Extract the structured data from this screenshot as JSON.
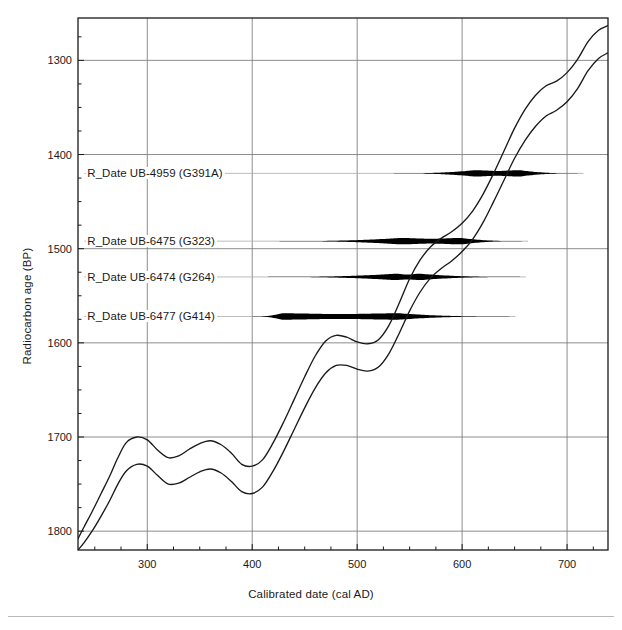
{
  "chart_data": {
    "type": "line",
    "title": "",
    "xlabel": "Calibrated date (cal AD)",
    "ylabel": "Radiocarbon age (BP)",
    "xlim": [
      234,
      739
    ],
    "ylim": [
      1820,
      1255
    ],
    "y_inverted": true,
    "grid": true,
    "legend": "none",
    "x_ticks_major": [
      300,
      400,
      500,
      600,
      700
    ],
    "x_ticks_minor_step": 25,
    "y_ticks_major": [
      1300,
      1400,
      1500,
      1600,
      1700,
      1800
    ],
    "y_ticks_minor_step": 25,
    "series": [
      {
        "name": "calibration-curve-upper",
        "x": [
          234,
          240,
          248,
          256,
          264,
          272,
          280,
          290,
          300,
          310,
          320,
          330,
          340,
          350,
          360,
          370,
          380,
          390,
          400,
          410,
          420,
          430,
          440,
          450,
          460,
          470,
          480,
          490,
          500,
          510,
          520,
          530,
          540,
          550,
          560,
          570,
          580,
          590,
          600,
          610,
          620,
          630,
          640,
          650,
          660,
          670,
          680,
          690,
          700,
          710,
          720,
          730,
          739
        ],
        "y": [
          1808,
          1795,
          1778,
          1760,
          1742,
          1722,
          1706,
          1700,
          1703,
          1714,
          1722,
          1720,
          1713,
          1707,
          1704,
          1708,
          1717,
          1729,
          1731,
          1724,
          1706,
          1684,
          1660,
          1636,
          1614,
          1598,
          1592,
          1594,
          1599,
          1601,
          1597,
          1582,
          1558,
          1532,
          1512,
          1498,
          1489,
          1482,
          1473,
          1460,
          1442,
          1420,
          1396,
          1372,
          1352,
          1337,
          1327,
          1322,
          1313,
          1299,
          1280,
          1268,
          1263
        ]
      },
      {
        "name": "calibration-curve-lower",
        "x": [
          234,
          240,
          248,
          256,
          264,
          272,
          280,
          290,
          300,
          310,
          320,
          330,
          340,
          350,
          360,
          370,
          380,
          390,
          400,
          410,
          420,
          430,
          440,
          450,
          460,
          470,
          480,
          490,
          500,
          510,
          520,
          530,
          540,
          550,
          560,
          570,
          580,
          590,
          600,
          610,
          620,
          630,
          640,
          650,
          660,
          670,
          680,
          690,
          700,
          710,
          720,
          730,
          739
        ],
        "y": [
          1820,
          1812,
          1799,
          1784,
          1768,
          1750,
          1736,
          1729,
          1731,
          1741,
          1750,
          1749,
          1743,
          1737,
          1734,
          1738,
          1747,
          1758,
          1760,
          1753,
          1736,
          1715,
          1692,
          1669,
          1648,
          1632,
          1624,
          1624,
          1628,
          1630,
          1626,
          1612,
          1590,
          1566,
          1546,
          1531,
          1521,
          1513,
          1503,
          1490,
          1472,
          1450,
          1427,
          1404,
          1385,
          1370,
          1359,
          1353,
          1344,
          1330,
          1311,
          1298,
          1292
        ]
      }
    ],
    "distributions": [
      {
        "label": "R_Date UB-4959 (G391A)",
        "lab_code": "UB-4959",
        "sample_id": "G391A",
        "baseline_bp": 1420,
        "range_start": 535,
        "range_end": 710,
        "peak_start": 612,
        "peak_end": 655,
        "label_x": 240
      },
      {
        "label": "R_Date UB-6475 (G323)",
        "lab_code": "UB-6475",
        "sample_id": "G323",
        "baseline_bp": 1492,
        "range_start": 426,
        "range_end": 657,
        "peak_start": 540,
        "peak_end": 600,
        "label_x": 240
      },
      {
        "label": "R_Date UB-6474 (G264)",
        "lab_code": "UB-6474",
        "sample_id": "G264",
        "baseline_bp": 1530,
        "range_start": 415,
        "range_end": 655,
        "peak_start": 536,
        "peak_end": 560,
        "label_x": 240
      },
      {
        "label": "R_Date UB-6477 (G414)",
        "lab_code": "UB-6477",
        "sample_id": "G414",
        "baseline_bp": 1572,
        "range_start": 400,
        "range_end": 645,
        "peak_start": 428,
        "peak_end": 540,
        "label_x": 240
      }
    ],
    "colors": {
      "curve": "#1a1a1a",
      "grid": "#808080",
      "axis": "#1a1a1a",
      "distribution": "#000000",
      "distribution_baseline": "#b0b0b0",
      "background": "#ffffff"
    }
  },
  "axes": {
    "y_title": "Radiocarbon age (BP)",
    "x_title": "Calibrated date (cal AD)",
    "y_tick_labels": [
      "1300",
      "1400",
      "1500",
      "1600",
      "1700",
      "1800"
    ],
    "x_tick_labels": [
      "300",
      "400",
      "500",
      "600",
      "700"
    ]
  },
  "labels": {
    "d0": "R_Date UB-4959 (G391A)",
    "d1": "R_Date UB-6475 (G323)",
    "d2": "R_Date UB-6474 (G264)",
    "d3": "R_Date UB-6477 (G414)"
  }
}
